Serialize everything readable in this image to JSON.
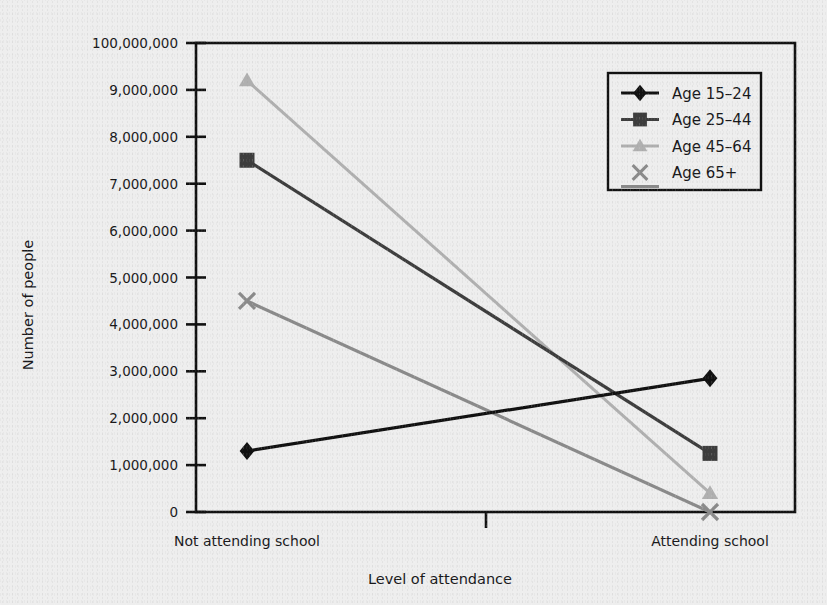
{
  "chart_data": {
    "type": "line",
    "title": "",
    "xlabel": "Level of attendance",
    "ylabel": "Number of people",
    "categories": [
      "Not attending school",
      "Attending school"
    ],
    "ytick_labels": [
      "0",
      "1,000,000",
      "2,000,000",
      "3,000,000",
      "4,000,000",
      "5,000,000",
      "6,000,000",
      "7,000,000",
      "8,000,000",
      "9,000,000",
      "100,000,000"
    ],
    "ytick_values": [
      0,
      1000000,
      2000000,
      3000000,
      4000000,
      5000000,
      6000000,
      7000000,
      8000000,
      9000000,
      10000000
    ],
    "ylim": [
      0,
      10000000
    ],
    "grid": false,
    "legend_position": "top-right",
    "series": [
      {
        "name": "Age 15–24",
        "marker": "diamond",
        "color": "#111111",
        "values": [
          1300000,
          2850000
        ]
      },
      {
        "name": "Age 25–44",
        "marker": "square",
        "color": "#3d3d3d",
        "values": [
          7500000,
          1250000
        ]
      },
      {
        "name": "Age 45–64",
        "marker": "triangle",
        "color": "#b0b0b0",
        "values": [
          9200000,
          400000
        ]
      },
      {
        "name": "Age 65+",
        "marker": "cross",
        "color": "#8a8a8a",
        "values": [
          4500000,
          0
        ]
      }
    ]
  },
  "legend": {
    "items": [
      {
        "label": "Age 15–24"
      },
      {
        "label": "Age 25–44"
      },
      {
        "label": "Age 45–64"
      },
      {
        "label": "Age 65+"
      }
    ]
  },
  "axes": {
    "y_title": "Number of people",
    "x_title": "Level of attendance",
    "x_categories": [
      "Not attending school",
      "Attending school"
    ]
  }
}
